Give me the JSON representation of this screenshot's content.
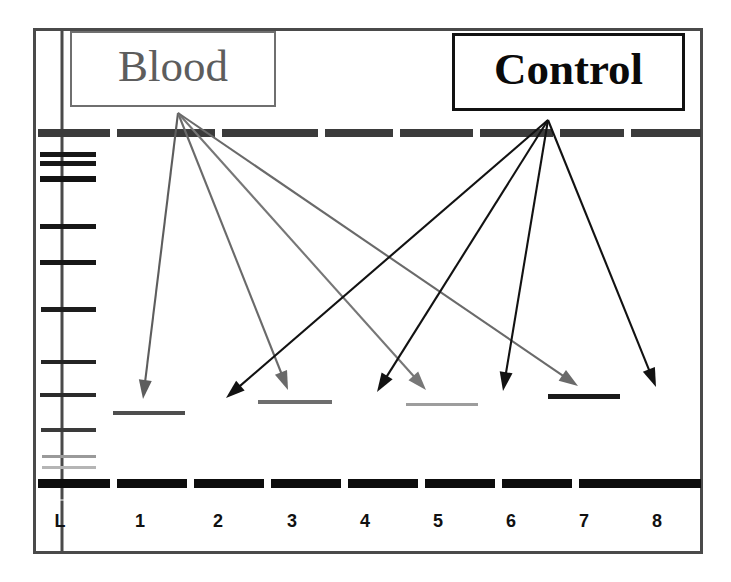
{
  "figure": {
    "type": "gel-electrophoresis",
    "title_visible": false,
    "frame": {
      "x": 33,
      "y": 28,
      "width": 670,
      "height": 526,
      "border_color": "#4a4a4a"
    },
    "ladder_divider_x": 62
  },
  "annotations": [
    {
      "id": "blood",
      "label": "Blood",
      "color": "#5d5d5d",
      "border_color": "#6f6f6f",
      "style": "serif-regular",
      "origin": {
        "x": 178,
        "y": 113
      },
      "points_to_lanes": [
        1,
        3,
        5,
        7
      ]
    },
    {
      "id": "control",
      "label": "Control",
      "color": "#0a0a0a",
      "border_color": "#111111",
      "style": "serif-bold",
      "origin": {
        "x": 548,
        "y": 120
      },
      "points_to_lanes": [
        2,
        4,
        6,
        8
      ]
    }
  ],
  "lanes": [
    {
      "label": "L",
      "center_x": 47,
      "label_x": 40
    },
    {
      "label": "1",
      "center_x": 140,
      "label_x": 120
    },
    {
      "label": "2",
      "center_x": 218,
      "label_x": 198
    },
    {
      "label": "3",
      "center_x": 292,
      "label_x": 272
    },
    {
      "label": "4",
      "center_x": 365,
      "label_x": 345
    },
    {
      "label": "5",
      "center_x": 438,
      "label_x": 418
    },
    {
      "label": "6",
      "center_x": 511,
      "label_x": 491
    },
    {
      "label": "7",
      "center_x": 584,
      "label_x": 564
    },
    {
      "label": "8",
      "center_x": 657,
      "label_x": 637
    }
  ],
  "wells_row": {
    "y": 129,
    "height": 8,
    "color": "#3b3b3b",
    "segments": [
      {
        "x": 38,
        "width": 72
      },
      {
        "x": 117,
        "width": 98
      },
      {
        "x": 222,
        "width": 96
      },
      {
        "x": 325,
        "width": 68
      },
      {
        "x": 400,
        "width": 73
      },
      {
        "x": 480,
        "width": 73
      },
      {
        "x": 560,
        "width": 64
      },
      {
        "x": 631,
        "width": 70
      }
    ]
  },
  "front_row": {
    "y": 479,
    "height": 9,
    "color": "#0d0d0d",
    "segments": [
      {
        "x": 38,
        "width": 72
      },
      {
        "x": 117,
        "width": 70
      },
      {
        "x": 194,
        "width": 70
      },
      {
        "x": 271,
        "width": 70
      },
      {
        "x": 348,
        "width": 70
      },
      {
        "x": 425,
        "width": 70
      },
      {
        "x": 502,
        "width": 70
      },
      {
        "x": 579,
        "width": 70
      },
      {
        "x": 640,
        "width": 61
      }
    ]
  },
  "ladder_bands": [
    {
      "y": 152,
      "x": 40,
      "width": 56,
      "height": 5,
      "color": "#171717"
    },
    {
      "y": 161,
      "x": 40,
      "width": 56,
      "height": 5,
      "color": "#171717"
    },
    {
      "y": 176,
      "x": 40,
      "width": 56,
      "height": 6,
      "color": "#121212"
    },
    {
      "y": 224,
      "x": 40,
      "width": 56,
      "height": 5,
      "color": "#171717"
    },
    {
      "y": 260,
      "x": 40,
      "width": 56,
      "height": 5,
      "color": "#171717"
    },
    {
      "y": 307,
      "x": 41,
      "width": 55,
      "height": 5,
      "color": "#1d1d1d"
    },
    {
      "y": 360,
      "x": 41,
      "width": 55,
      "height": 4,
      "color": "#242424"
    },
    {
      "y": 393,
      "x": 40,
      "width": 56,
      "height": 4,
      "color": "#2b2b2b"
    },
    {
      "y": 428,
      "x": 41,
      "width": 55,
      "height": 4,
      "color": "#3a3a3a"
    },
    {
      "y": 455,
      "x": 42,
      "width": 54,
      "height": 3,
      "color": "#9a9a9a"
    },
    {
      "y": 466,
      "x": 42,
      "width": 54,
      "height": 3,
      "color": "#b5b5b5"
    }
  ],
  "sample_bands": [
    {
      "lane": 1,
      "x": 113,
      "y": 411,
      "width": 72,
      "height": 4,
      "color": "#4e4e4e",
      "shade": "medium-gray"
    },
    {
      "lane": 3,
      "x": 258,
      "y": 400,
      "width": 74,
      "height": 4,
      "color": "#6e6e6e",
      "shade": "gray"
    },
    {
      "lane": 5,
      "x": 406,
      "y": 403,
      "width": 72,
      "height": 3,
      "color": "#9d9d9d",
      "shade": "light-gray"
    },
    {
      "lane": 7,
      "x": 548,
      "y": 394,
      "width": 72,
      "height": 5,
      "color": "#1a1a1a",
      "shade": "dark"
    }
  ],
  "arrows": [
    {
      "group": "blood",
      "from": {
        "x": 178,
        "y": 113
      },
      "to": {
        "x": 143,
        "y": 399
      },
      "color": "#5d5d5d"
    },
    {
      "group": "blood",
      "from": {
        "x": 178,
        "y": 113
      },
      "to": {
        "x": 288,
        "y": 390
      },
      "color": "#6a6a6a"
    },
    {
      "group": "blood",
      "from": {
        "x": 178,
        "y": 113
      },
      "to": {
        "x": 426,
        "y": 390
      },
      "color": "#777777"
    },
    {
      "group": "blood",
      "from": {
        "x": 178,
        "y": 113
      },
      "to": {
        "x": 578,
        "y": 386
      },
      "color": "#6a6a6a"
    },
    {
      "group": "control",
      "from": {
        "x": 548,
        "y": 120
      },
      "to": {
        "x": 226,
        "y": 398
      },
      "color": "#121212"
    },
    {
      "group": "control",
      "from": {
        "x": 548,
        "y": 120
      },
      "to": {
        "x": 377,
        "y": 392
      },
      "color": "#121212"
    },
    {
      "group": "control",
      "from": {
        "x": 548,
        "y": 120
      },
      "to": {
        "x": 503,
        "y": 391
      },
      "color": "#121212"
    },
    {
      "group": "control",
      "from": {
        "x": 548,
        "y": 120
      },
      "to": {
        "x": 656,
        "y": 387
      },
      "color": "#121212"
    }
  ]
}
